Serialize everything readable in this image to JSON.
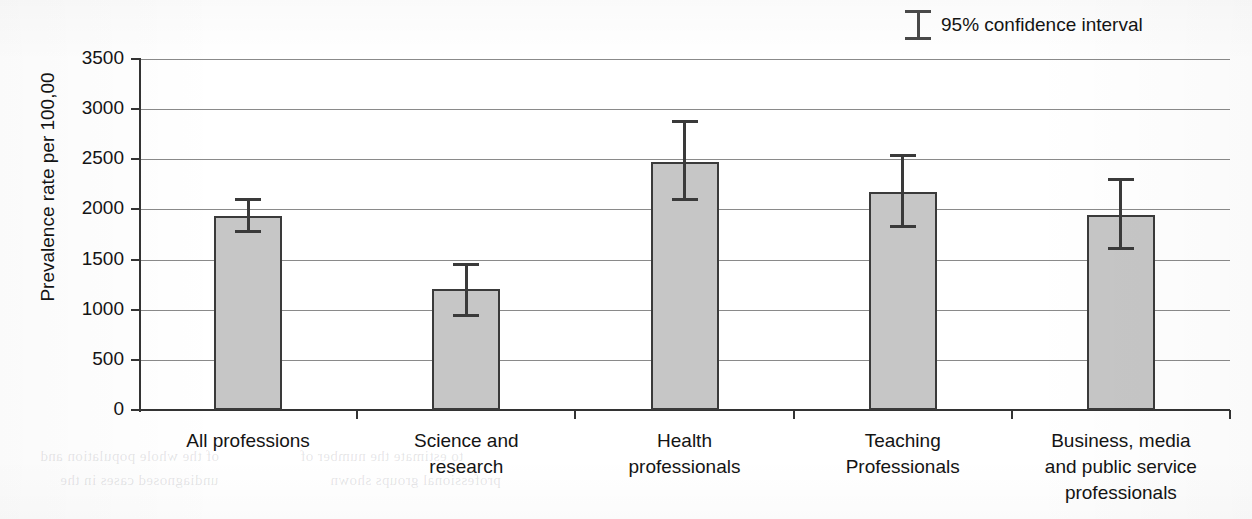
{
  "chart_data": {
    "type": "bar",
    "title": "",
    "xlabel": "",
    "ylabel": "Prevalence rate per 100,00",
    "ylim": [
      0,
      3500
    ],
    "ytick_step": 500,
    "yticks": [
      "0",
      "500",
      "1000",
      "1500",
      "2000",
      "2500",
      "3000",
      "3500"
    ],
    "grid": true,
    "legend_position": "top-right",
    "legend_entries": [
      "95% confidence interval"
    ],
    "categories": [
      "All professions",
      "Science and research",
      "Health professionals",
      "Teaching Professionals",
      "Business, media and public service professionals"
    ],
    "category_lines": [
      [
        "All professions"
      ],
      [
        "Science and",
        "research"
      ],
      [
        "Health",
        "professionals"
      ],
      [
        "Teaching",
        "Professionals"
      ],
      [
        "Business, media",
        "and public service",
        "professionals"
      ]
    ],
    "values": [
      1930,
      1210,
      2470,
      2170,
      1940
    ],
    "ci_lower": [
      1760,
      930,
      2080,
      1810,
      1600
    ],
    "ci_upper": [
      2110,
      1470,
      2890,
      2550,
      2310
    ],
    "series": [
      {
        "name": "Prevalence rate per 100,00",
        "values": [
          1930,
          1210,
          2470,
          2170,
          1940
        ]
      }
    ],
    "bar_color": "#c6c6c6",
    "bar_border_color": "#3a3a3a",
    "errorbar_color": "#3a3a3a"
  },
  "legend": {
    "symbol": "error-bar-i-beam",
    "label": "95% confidence interval"
  },
  "axes": {
    "y_title": "Prevalence rate per 100,00"
  },
  "artifacts": {
    "bleed_text": [
      "of the whole population and",
      "to estimate the number of",
      "undiagnosed cases in the",
      "professional groups shown"
    ]
  }
}
